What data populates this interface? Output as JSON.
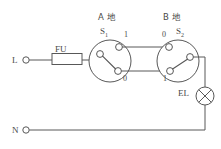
{
  "diagram": {
    "colors": {
      "line": "#585858",
      "background": "#ffffff",
      "text": "#4a4a4a"
    },
    "supply": {
      "live_terminal_label": "L",
      "neutral_terminal_label": "N"
    },
    "fuse": {
      "label": "FU"
    },
    "lamp": {
      "label": "EL"
    },
    "switch_a": {
      "site_label": "A 地",
      "name_label": "S",
      "name_subscript": "1",
      "terminal_top_label": "1",
      "terminal_bottom_label": "0"
    },
    "switch_b": {
      "site_label": "B 地",
      "name_label": "S",
      "name_subscript": "2",
      "terminal_top_label": "0",
      "terminal_bottom_label": "1"
    }
  }
}
